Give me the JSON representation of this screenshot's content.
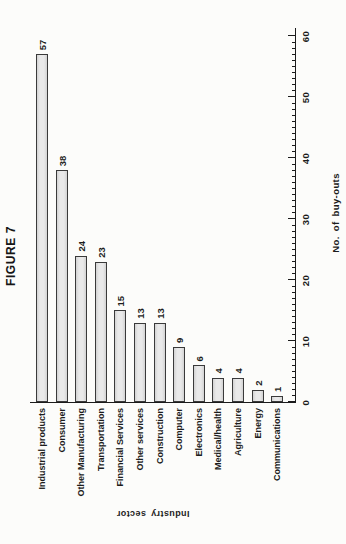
{
  "figure": {
    "title": "FIGURE 7",
    "orientation_note": "landscape figure printed rotated 90deg counterclockwise on portrait page"
  },
  "chart_data": {
    "type": "bar",
    "orientation": "horizontal",
    "title": "FIGURE 7",
    "categories": [
      "Industrial products",
      "Consumer",
      "Other Manufacturing",
      "Transportation",
      "Financial Services",
      "Other services",
      "Construction",
      "Computer",
      "Electronics",
      "Medical/health",
      "Agriculture",
      "Energy",
      "Communications"
    ],
    "values": [
      57,
      38,
      24,
      23,
      15,
      13,
      13,
      9,
      6,
      4,
      4,
      2,
      1
    ],
    "value_axis_label": "No. of buy-outs",
    "category_axis_label": "Industry sector",
    "value_ticks": [
      0,
      10,
      20,
      30,
      40,
      50,
      60
    ],
    "minor_tick_step": 1,
    "value_axis_range": [
      0,
      60
    ],
    "grid": false,
    "legend": false,
    "bar_labels_shown": true,
    "colors": {
      "bar_fill": "#e9e9e9",
      "bar_fill_edge": "#d3d3d3",
      "bar_border": "#3a3a3a",
      "ink": "#1b1b1b",
      "paper": "#fcfcfa"
    }
  }
}
